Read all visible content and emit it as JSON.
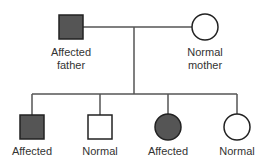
{
  "diagram": {
    "type": "pedigree",
    "colors": {
      "affected": "#555555",
      "normal": "#ffffff",
      "stroke": "#222222",
      "line": "#555555",
      "text": "#333333"
    },
    "parents": {
      "father": {
        "label_line1": "Affected",
        "label_line2": "father",
        "sex": "male",
        "status": "affected"
      },
      "mother": {
        "label_line1": "Normal",
        "label_line2": "mother",
        "sex": "female",
        "status": "normal"
      }
    },
    "children": [
      {
        "label": "Affected",
        "sex": "male",
        "status": "affected"
      },
      {
        "label": "Normal",
        "sex": "male",
        "status": "normal"
      },
      {
        "label": "Affected",
        "sex": "female",
        "status": "affected"
      },
      {
        "label": "Normal",
        "sex": "female",
        "status": "normal"
      }
    ]
  }
}
